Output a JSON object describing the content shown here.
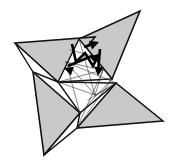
{
  "figure": {
    "style": "line drawing with shaded flaps and fold arrows",
    "background_color": "#ffffff",
    "canvas": {
      "width": 172,
      "height": 165
    }
  },
  "colors": {
    "paper_shaded": "#c9c9c9",
    "paper_shaded_dark": "#b4b4b4",
    "paper_white": "#ffffff",
    "outline": "#111111",
    "crease": "#222222",
    "arrow": "#000000"
  },
  "strokes": {
    "outline_width": 1.6,
    "crease_width": 0.55,
    "arrow_shaft_width": 2.6
  },
  "points": [
    {
      "name": "point-top-right",
      "label": "top right blade tip",
      "x": 140,
      "y": 11
    },
    {
      "name": "point-left",
      "label": "left blade tip",
      "x": 15,
      "y": 43
    },
    {
      "name": "point-bottom-left",
      "label": "bottom left blade tip",
      "x": 44,
      "y": 155
    },
    {
      "name": "point-bottom-right",
      "label": "right blade tip",
      "x": 163,
      "y": 121
    }
  ],
  "shapes": {
    "blade_top_right": "140,11 112,79 79,39",
    "blade_left": "15,43 95,37 58,82",
    "blade_bottom_left": "44,155 33,72 80,113",
    "blade_bottom_right": "163,121 77,128 116,83",
    "center_white_a": "79,39 112,79 58,82",
    "center_white_b": "58,82 80,113 116,83",
    "flap_white_left": "15,43 58,82 33,72",
    "flap_white_bottom": "44,155 80,113 77,128"
  },
  "creases": [
    "58,82 112,79",
    "58,82 79,39",
    "79,39 112,79",
    "80,113 116,83",
    "58,82 116,83",
    "80,113 112,79",
    "66,62 103,70",
    "66,62 95,95",
    "95,95 103,70",
    "58,82 95,95",
    "66,62 80,113",
    "79,39 95,95",
    "103,70 77,128",
    "112,79 77,128",
    "66,62 116,83",
    "58,82 103,70",
    "95,95 116,83",
    "33,72 80,113",
    "70,50 97,57",
    "88,100 115,84"
  ],
  "arrows": [
    {
      "name": "fold-arrow-zigzag",
      "type": "zigzag-fold-arrow",
      "path": "72,44 76,62 85,53 93,66 99,54",
      "head_at": "99,54",
      "head_angle": -40
    },
    {
      "name": "fold-arrow-down",
      "type": "straight-fold-arrow",
      "path": "100,49 98,72",
      "head_at": "98,76",
      "head_angle": 95
    },
    {
      "name": "fold-arrow-left",
      "type": "straight-fold-arrow",
      "path": "92,56 68,66",
      "head_at": "64,68",
      "head_angle": 200
    },
    {
      "name": "fold-arrow-short-upper",
      "type": "straight-fold-arrow",
      "path": "84,47 96,43",
      "head_at": "99,42",
      "head_angle": -20
    }
  ],
  "labels": {
    "figure_caption": "",
    "step_number": ""
  }
}
